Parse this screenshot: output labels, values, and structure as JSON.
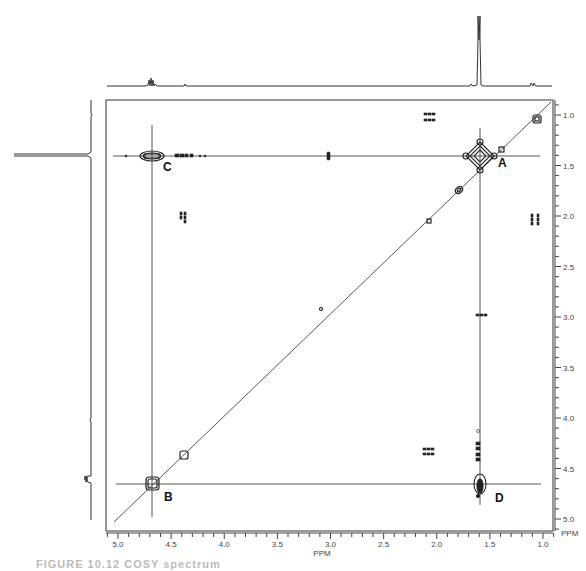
{
  "chart_data": {
    "type": "heatmap",
    "subtype": "2D COSY NMR contour plot",
    "title": "",
    "xlabel": "PPM",
    "ylabel": "PPM",
    "xlim": [
      5.1,
      0.9
    ],
    "ylim": [
      0.9,
      5.1
    ],
    "x_ticks": [
      "5.0",
      "4.5",
      "4.0",
      "3.5",
      "3.0",
      "2.5",
      "2.0",
      "1.5",
      "1.0"
    ],
    "y_ticks": [
      "1.0",
      "1.5",
      "2.0",
      "2.5",
      "3.0",
      "3.5",
      "4.0",
      "4.5",
      "5.0"
    ],
    "grid": false,
    "diagonal_peaks": [
      {
        "ppm": 4.67,
        "label": "B"
      },
      {
        "ppm": 4.37
      },
      {
        "ppm": 2.95
      },
      {
        "ppm": 2.05
      },
      {
        "ppm": 1.75
      },
      {
        "ppm": 1.56,
        "label": "A"
      },
      {
        "ppm": 1.32
      },
      {
        "ppm": 1.02
      }
    ],
    "cross_peaks": [
      {
        "x": 4.67,
        "y": 1.56,
        "label": "C"
      },
      {
        "x": 1.56,
        "y": 4.67,
        "label": "D"
      },
      {
        "x": 2.98,
        "y": 1.56
      },
      {
        "x": 4.4,
        "y": 2.05
      },
      {
        "x": 2.05,
        "y": 1.0
      },
      {
        "x": 1.0,
        "y": 2.05
      },
      {
        "x": 2.05,
        "y": 4.37
      },
      {
        "x": 1.56,
        "y": 3.0
      },
      {
        "x": 1.56,
        "y": 4.3
      }
    ],
    "crosshair_lines": [
      {
        "orientation": "horizontal",
        "ppm": 1.56
      },
      {
        "orientation": "horizontal",
        "ppm": 4.67
      },
      {
        "orientation": "vertical",
        "ppm": 4.67
      },
      {
        "orientation": "vertical",
        "ppm": 1.56
      }
    ],
    "projections": {
      "top": {
        "peaks_ppm": [
          4.67,
          4.37,
          1.56,
          1.02
        ],
        "dominant_ppm": 1.56
      },
      "left": {
        "peaks_ppm": [
          1.0,
          1.56,
          4.3,
          4.67
        ],
        "dominant_ppm": 1.56
      }
    },
    "annotations": [
      "A",
      "B",
      "C",
      "D"
    ]
  },
  "labels": {
    "peak_a": "A",
    "peak_b": "B",
    "peak_c": "C",
    "peak_d": "D",
    "x_axis_title": "PPM",
    "y_axis_title": "PPM"
  },
  "caption": "FIGURE 10.12  COSY spectrum"
}
